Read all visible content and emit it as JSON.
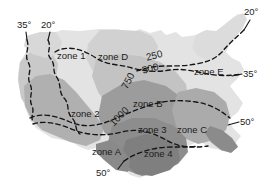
{
  "figure": {
    "name": "us-climate-zone-map",
    "type": "shaded-relief-zone-map",
    "background": "#ffffff"
  },
  "palette": {
    "lightest": "#e2e2e2",
    "light": "#d2d2d2",
    "mid_light": "#c2c2c2",
    "mid": "#aeaeae",
    "mid_dark": "#9a9a9a",
    "dark": "#8a8a8a",
    "darkest": "#7b7b7b",
    "line": "#1a1a1a",
    "text": "#1b1b1b"
  },
  "zone_labels": [
    {
      "id": "zone-1",
      "text": "zone 1",
      "x": 57,
      "y": 51,
      "rotate": 0
    },
    {
      "id": "zone-d",
      "text": "zone D",
      "x": 98,
      "y": 52,
      "rotate": 0
    },
    {
      "id": "zone-e",
      "text": "zone E",
      "x": 194,
      "y": 67,
      "rotate": 0
    },
    {
      "id": "zone-2",
      "text": "zone 2",
      "x": 71,
      "y": 109,
      "rotate": 0
    },
    {
      "id": "zone-b",
      "text": "zone B",
      "x": 133,
      "y": 99,
      "rotate": 0
    },
    {
      "id": "zone-3",
      "text": "zone 3",
      "x": 138,
      "y": 125,
      "rotate": 0
    },
    {
      "id": "zone-c",
      "text": "zone C",
      "x": 177,
      "y": 125,
      "rotate": 0
    },
    {
      "id": "zone-a",
      "text": "zone A",
      "x": 92,
      "y": 147,
      "rotate": 0
    },
    {
      "id": "zone-4",
      "text": "zone 4",
      "x": 144,
      "y": 149,
      "rotate": 0
    }
  ],
  "contour_labels": [
    {
      "id": "contour-250",
      "text": "250",
      "x": 145,
      "y": 53,
      "rotate": -14
    },
    {
      "id": "contour-500",
      "text": "500",
      "x": 141,
      "y": 66,
      "rotate": -14
    },
    {
      "id": "contour-750",
      "text": "750",
      "x": 120,
      "y": 86,
      "rotate": -62
    },
    {
      "id": "contour-1000",
      "text": "1000",
      "x": 108,
      "y": 121,
      "rotate": -45
    }
  ],
  "degree_labels": [
    {
      "id": "deg-35-topleft",
      "text": "35°",
      "x": 17,
      "y": 20,
      "rotate": 0
    },
    {
      "id": "deg-20-topleft",
      "text": "20°",
      "x": 41,
      "y": 20,
      "rotate": 0
    },
    {
      "id": "deg-20-topright",
      "text": "20°",
      "x": 244,
      "y": 7,
      "rotate": 0
    },
    {
      "id": "deg-35-right",
      "text": "35°",
      "x": 243,
      "y": 69,
      "rotate": 0
    },
    {
      "id": "deg-50-right",
      "text": "50°",
      "x": 240,
      "y": 117,
      "rotate": 0
    },
    {
      "id": "deg-50-bottom",
      "text": "50°",
      "x": 96,
      "y": 168,
      "rotate": 0
    }
  ],
  "leader_lines": [
    {
      "id": "leader-35-topleft",
      "d": "M26,32 L27,40"
    },
    {
      "id": "leader-20-topleft",
      "d": "M50,32 L48,40"
    },
    {
      "id": "leader-20-topright",
      "d": "M250,20 L244,30"
    },
    {
      "id": "leader-35-right",
      "d": "M242,74 L232,76"
    },
    {
      "id": "leader-50-right",
      "d": "M239,122 L228,125"
    },
    {
      "id": "leader-50-bottom",
      "d": "M118,169 L124,161"
    }
  ]
}
